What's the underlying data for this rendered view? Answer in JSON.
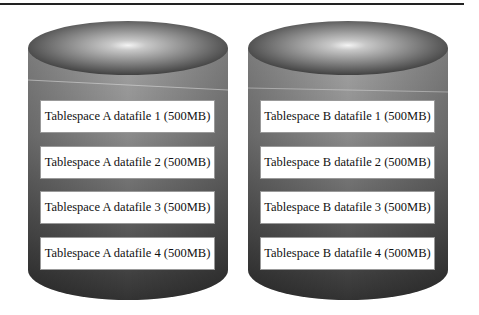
{
  "diagram": {
    "cylinders": [
      {
        "name": "Tablespace A",
        "datafiles": [
          "Tablespace A datafile 1 (500MB)",
          "Tablespace A datafile 2 (500MB)",
          "Tablespace A datafile 3 (500MB)",
          "Tablespace A datafile 4 (500MB)"
        ]
      },
      {
        "name": "Tablespace B",
        "datafiles": [
          "Tablespace B datafile 1 (500MB)",
          "Tablespace B datafile 2 (500MB)",
          "Tablespace B datafile 3 (500MB)",
          "Tablespace B datafile 4 (500MB)"
        ]
      }
    ],
    "colors": {
      "body_top": "#9a9a9a",
      "body_bottom": "#3a3a3a",
      "box_fill": "#ffffff",
      "rule": "#222222"
    }
  }
}
